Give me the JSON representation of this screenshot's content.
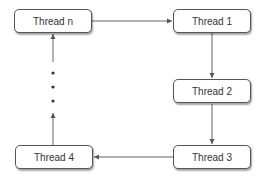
{
  "diagram": {
    "type": "thread ring / cycle",
    "nodes": [
      {
        "id": "thread-n",
        "label": "Thread n"
      },
      {
        "id": "thread-1",
        "label": "Thread 1"
      },
      {
        "id": "thread-2",
        "label": "Thread 2"
      },
      {
        "id": "thread-3",
        "label": "Thread 3"
      },
      {
        "id": "thread-4",
        "label": "Thread 4"
      }
    ],
    "edges": [
      {
        "from": "thread-n",
        "to": "thread-1"
      },
      {
        "from": "thread-1",
        "to": "thread-2"
      },
      {
        "from": "thread-2",
        "to": "thread-3"
      },
      {
        "from": "thread-3",
        "to": "thread-4"
      },
      {
        "from": "thread-4",
        "to": "ellipsis"
      },
      {
        "from": "ellipsis",
        "to": "thread-n"
      }
    ],
    "ellipsis": "vertical dots between Thread 4 and Thread n",
    "colors": {
      "line": "#666666",
      "border": "#555555",
      "text": "#333333"
    }
  }
}
